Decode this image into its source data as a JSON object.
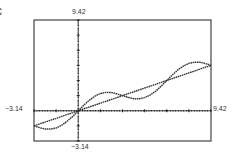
{
  "label_fragment": "c",
  "window": {
    "xmin_label": "-3.14",
    "xmax_label": "9.42",
    "ymin_label": "-3.14",
    "ymax_label": "9.42"
  },
  "chart_data": {
    "type": "line",
    "title": "",
    "xlabel": "",
    "ylabel": "",
    "xlim": [
      -3.14,
      9.42
    ],
    "ylim": [
      -3.14,
      9.42
    ],
    "xscale_tick": 1.57,
    "yscale_tick": 1.57,
    "grid": false,
    "legend": null,
    "frame": {
      "left": 34,
      "top": 20,
      "right": 211,
      "bottom": 141
    },
    "x": [
      -3.14,
      -2.75,
      -2.36,
      -1.96,
      -1.57,
      -1.18,
      -0.79,
      -0.39,
      0,
      0.39,
      0.79,
      1.18,
      1.57,
      1.96,
      2.36,
      2.75,
      3.14,
      3.53,
      3.93,
      4.32,
      4.71,
      5.11,
      5.5,
      5.89,
      6.28,
      6.68,
      7.07,
      7.46,
      7.85,
      8.25,
      8.64,
      9.03,
      9.42
    ],
    "series": [
      {
        "name": "y = x/2",
        "values": [
          -1.57,
          -1.37,
          -1.18,
          -0.98,
          -0.79,
          -0.59,
          -0.39,
          -0.2,
          0,
          0.2,
          0.39,
          0.59,
          0.79,
          0.98,
          1.18,
          1.37,
          1.57,
          1.77,
          1.96,
          2.16,
          2.36,
          2.55,
          2.75,
          2.95,
          3.14,
          3.34,
          3.53,
          3.73,
          3.93,
          4.12,
          4.32,
          4.52,
          4.71
        ]
      },
      {
        "name": "y = x/2 + sin(x)",
        "values": [
          -1.57,
          -1.75,
          -1.89,
          -1.9,
          -1.79,
          -1.51,
          -1.1,
          -0.58,
          0,
          0.58,
          1.1,
          1.51,
          1.79,
          1.9,
          1.89,
          1.75,
          1.57,
          1.39,
          1.25,
          1.24,
          1.36,
          1.63,
          2.04,
          2.57,
          3.14,
          3.72,
          4.24,
          4.65,
          4.93,
          5.04,
          5.03,
          4.9,
          4.71
        ]
      }
    ],
    "colors": {
      "axis": "#222222",
      "curve": "#333333",
      "frame": "#444444"
    }
  }
}
